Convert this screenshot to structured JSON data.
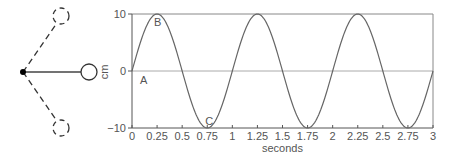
{
  "pendulum": {
    "pivot": {
      "x": 23,
      "y": 72
    },
    "bob_rest": {
      "x": 89,
      "y": 72,
      "r": 8
    },
    "bob_up": {
      "x": 61,
      "y": 16,
      "r": 8
    },
    "bob_down": {
      "x": 61,
      "y": 128,
      "r": 8
    }
  },
  "chart_data": {
    "type": "line",
    "title": "",
    "xlabel": "seconds",
    "ylabel": "cm",
    "xlim": [
      0,
      3
    ],
    "ylim": [
      -10,
      10
    ],
    "x_ticks": [
      "0",
      "0.25",
      "0.5",
      "0.75",
      "1",
      "1.25",
      "1.5",
      "1.75",
      "2",
      "2.25",
      "2.5",
      "2.75",
      "3"
    ],
    "y_ticks": [
      "10",
      "0",
      "−10"
    ],
    "series": [
      {
        "name": "displacement",
        "function": "10*sin(2*pi*t)",
        "amplitude": 10,
        "period": 1,
        "x": [
          0,
          0.25,
          0.5,
          0.75,
          1,
          1.25,
          1.5,
          1.75,
          2,
          2.25,
          2.5,
          2.75,
          3
        ],
        "values": [
          0,
          10,
          0,
          -10,
          0,
          10,
          0,
          -10,
          0,
          10,
          0,
          -10,
          0
        ]
      }
    ],
    "annotations": [
      {
        "label": "A",
        "x": 0,
        "y": 0
      },
      {
        "label": "B",
        "x": 0.25,
        "y": 10
      },
      {
        "label": "C",
        "x": 0.75,
        "y": -10
      }
    ],
    "grid": false,
    "reference_lines": [
      10,
      0
    ]
  },
  "colors": {
    "line": "#666666",
    "axis": "#555555",
    "ref": "#aaaaaa",
    "text": "#555555"
  }
}
